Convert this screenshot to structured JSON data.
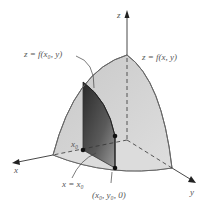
{
  "figure": {
    "colors": {
      "surface_fill": "#d4d4d4",
      "surface_edge": "#707070",
      "slice_dark": "#3a3a3a",
      "slice_light": "#9a9a9a",
      "axis": "#333333",
      "label": "#555555"
    },
    "axes": {
      "x_label": "x",
      "y_label": "y",
      "z_label": "z"
    },
    "labels": {
      "trace_curve": "z = f(x₀, y)",
      "surface": "z = f(x, y)",
      "x0_point": "x₀",
      "plane": "x = x₀",
      "base_point": "(x₀, y₀, 0)"
    }
  }
}
